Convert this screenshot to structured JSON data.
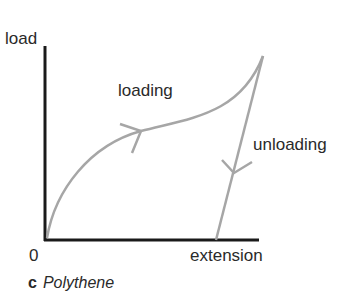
{
  "diagram": {
    "caption_letter": "c",
    "caption_title": "Polythene",
    "y_axis_label": "load",
    "x_axis_label": "extension",
    "origin_label": "0",
    "curves": [
      {
        "name": "loading",
        "label": "loading",
        "direction": "up-right",
        "color": "#a6a6a6"
      },
      {
        "name": "unloading",
        "label": "unloading",
        "direction": "down-left",
        "color": "#a6a6a6"
      }
    ],
    "axis_color": "#1a1a1a"
  }
}
